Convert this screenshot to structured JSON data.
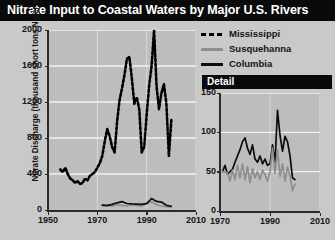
{
  "title": "Nitrate Input to Coastal Waters by Major U.S. Rivers",
  "colors": {
    "title_bar": "#0a0a0a",
    "title_text": "#ffffff",
    "figure_background": "#c9c9c9",
    "plot_background": "#bdbdbd",
    "gridline": "#f2f2f2",
    "axis": "#2b2b2b",
    "mississippi": "#000000",
    "susquehanna": "#8e8e8e",
    "columbia": "#0d0d0d"
  },
  "legend": {
    "items": [
      {
        "label": "Mississippi",
        "style": "dashed",
        "color": "#000000",
        "icon": "dashed-line-icon"
      },
      {
        "label": "Susquehanna",
        "style": "solid",
        "color": "#8e8e8e",
        "icon": "solid-line-icon"
      },
      {
        "label": "Columbia",
        "style": "solid",
        "color": "#0d0d0d",
        "icon": "solid-line-icon"
      }
    ]
  },
  "detail_panel": {
    "header": "Detail"
  },
  "chart_data": [
    {
      "id": "main",
      "type": "line",
      "title": "Nitrate Input to Coastal Waters by Major U.S. Rivers",
      "xlabel": "",
      "ylabel": "Nitrate Discharge (thousand short tons N per year)",
      "xlim": [
        1950,
        2010
      ],
      "ylim": [
        0,
        2000
      ],
      "xticks": [
        1950,
        1970,
        1990,
        2010
      ],
      "yticks": [
        0,
        400,
        800,
        1200,
        1600,
        2000
      ],
      "grid": true,
      "legend_position": "top-right",
      "series": [
        {
          "name": "Mississippi",
          "style": "dashed",
          "color": "#000000",
          "x": [
            1955,
            1956,
            1957,
            1958,
            1959,
            1960,
            1961,
            1962,
            1963,
            1964,
            1965,
            1966,
            1967,
            1968,
            1969,
            1970,
            1971,
            1972,
            1973,
            1974,
            1975,
            1976,
            1977,
            1978,
            1979,
            1980,
            1981,
            1982,
            1983,
            1984,
            1985,
            1986,
            1987,
            1988,
            1989,
            1990,
            1991,
            1992,
            1993,
            1994,
            1995,
            1996,
            1997,
            1998,
            1999,
            2000
          ],
          "y": [
            450,
            420,
            470,
            400,
            350,
            330,
            300,
            320,
            290,
            300,
            350,
            330,
            380,
            400,
            420,
            470,
            520,
            600,
            760,
            900,
            820,
            700,
            640,
            980,
            1220,
            1350,
            1500,
            1680,
            1700,
            1460,
            1180,
            1250,
            1120,
            640,
            700,
            1060,
            1380,
            1600,
            2000,
            1380,
            1120,
            1300,
            1400,
            1180,
            600,
            1000
          ]
        },
        {
          "name": "Susquehanna",
          "style": "solid",
          "color": "#8e8e8e",
          "x": [
            1972,
            1974,
            1976,
            1978,
            1980,
            1982,
            1984,
            1986,
            1988,
            1990,
            1992,
            1994,
            1996,
            1998,
            2000
          ],
          "y": [
            48,
            55,
            42,
            60,
            50,
            46,
            58,
            50,
            44,
            80,
            90,
            58,
            44,
            38,
            30
          ]
        },
        {
          "name": "Columbia",
          "style": "solid",
          "color": "#0d0d0d",
          "x": [
            1972,
            1974,
            1976,
            1978,
            1980,
            1982,
            1984,
            1986,
            1988,
            1990,
            1992,
            1994,
            1996,
            1998,
            2000
          ],
          "y": [
            55,
            48,
            62,
            80,
            93,
            72,
            68,
            66,
            62,
            70,
            128,
            95,
            88,
            52,
            42
          ]
        }
      ]
    },
    {
      "id": "detail",
      "type": "line",
      "title": "Detail",
      "xlabel": "",
      "ylabel": "",
      "xlim": [
        1970,
        2010
      ],
      "ylim": [
        0,
        150
      ],
      "xticks": [
        1970,
        1990,
        2010
      ],
      "yticks": [
        0,
        50,
        100,
        150
      ],
      "grid": true,
      "series": [
        {
          "name": "Columbia",
          "style": "solid",
          "color": "#0d0d0d",
          "x": [
            1971,
            1972,
            1973,
            1974,
            1975,
            1976,
            1977,
            1978,
            1979,
            1980,
            1981,
            1982,
            1983,
            1984,
            1985,
            1986,
            1987,
            1988,
            1989,
            1990,
            1991,
            1992,
            1993,
            1994,
            1995,
            1996,
            1997,
            1998,
            1999,
            2000
          ],
          "y": [
            50,
            58,
            47,
            50,
            53,
            62,
            70,
            78,
            88,
            93,
            80,
            72,
            84,
            66,
            62,
            70,
            60,
            66,
            58,
            60,
            84,
            62,
            128,
            96,
            76,
            95,
            88,
            70,
            42,
            40
          ]
        },
        {
          "name": "Susquehanna",
          "style": "solid",
          "color": "#8e8e8e",
          "x": [
            1971,
            1972,
            1973,
            1974,
            1975,
            1976,
            1977,
            1978,
            1979,
            1980,
            1981,
            1982,
            1983,
            1984,
            1985,
            1986,
            1987,
            1988,
            1989,
            1990,
            1991,
            1992,
            1993,
            1994,
            1995,
            1996,
            1997,
            1998,
            1999,
            2000
          ],
          "y": [
            50,
            50,
            48,
            38,
            52,
            40,
            58,
            42,
            60,
            40,
            56,
            36,
            54,
            42,
            50,
            40,
            52,
            46,
            38,
            50,
            80,
            48,
            78,
            44,
            60,
            38,
            56,
            44,
            26,
            34
          ]
        }
      ]
    }
  ]
}
